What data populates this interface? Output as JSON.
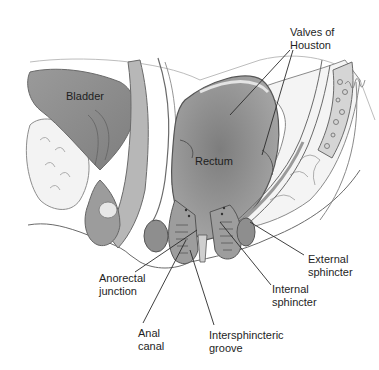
{
  "figure": {
    "colors": {
      "background": "#ffffff",
      "tissue_dark": "#8a8a8a",
      "tissue_mid": "#a9a9a9",
      "tissue_light": "#d2d2d2",
      "outline": "#5a5a5a",
      "leader": "#2a2a2a",
      "text": "#1e1e1e"
    },
    "labels": {
      "bladder": "Bladder",
      "rectum": "Rectum",
      "valves": [
        "Valves of",
        "Houston"
      ],
      "external_sphincter": [
        "External",
        "sphincter"
      ],
      "internal_sphincter": [
        "Internal",
        "sphincter"
      ],
      "anorectal_junction": [
        "Anorectal",
        "junction"
      ],
      "anal_canal": [
        "Anal",
        "canal"
      ],
      "intersphincteric_groove": [
        "Intersphincteric",
        "groove"
      ]
    }
  }
}
